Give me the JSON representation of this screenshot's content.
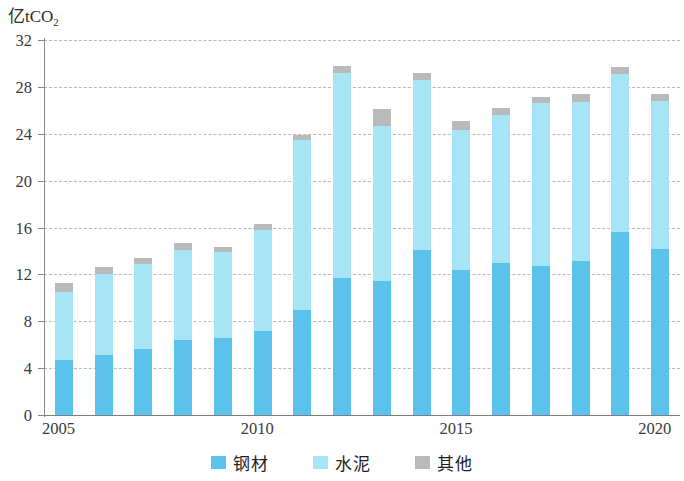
{
  "chart_data": {
    "type": "bar",
    "subtype": "stacked-bar",
    "title": "",
    "xlabel": "",
    "ylabel": "亿tCO₂",
    "ylabel_plain": "亿tCO2",
    "ylim": [
      0,
      32
    ],
    "ytick_step": 4,
    "ytick_labels": [
      "0",
      "4",
      "8",
      "12",
      "16",
      "20",
      "24",
      "28",
      "32"
    ],
    "ytick_values": [
      0,
      4,
      8,
      12,
      16,
      20,
      24,
      28,
      32
    ],
    "grid": true,
    "grid_style": "dashed",
    "grid_color": "#b9b9b9",
    "legend_position": "bottom-center",
    "categories": [
      "2005",
      "2006",
      "2007",
      "2008",
      "2009",
      "2010",
      "2011",
      "2012",
      "2013",
      "2014",
      "2015",
      "2016",
      "2017",
      "2018",
      "2019",
      "2020"
    ],
    "xtick_labels_shown": [
      "2005",
      "2010",
      "2015",
      "2020"
    ],
    "xtick_label_indices": [
      0,
      5,
      10,
      15
    ],
    "series": [
      {
        "name": "钢材",
        "name_en": "steel",
        "color": "#5bc2ec",
        "values": [
          4.7,
          5.1,
          5.6,
          6.4,
          6.6,
          7.2,
          9.0,
          11.7,
          11.4,
          14.1,
          12.4,
          13.0,
          12.7,
          13.1,
          15.6,
          14.2
        ]
      },
      {
        "name": "水泥",
        "name_en": "cement",
        "color": "#a7e4f6",
        "values": [
          5.8,
          6.9,
          7.3,
          7.7,
          7.3,
          8.6,
          14.5,
          17.5,
          13.3,
          14.5,
          11.9,
          12.6,
          13.9,
          13.6,
          13.5,
          12.6
        ]
      },
      {
        "name": "其他",
        "name_en": "other",
        "color": "#b9bbbb",
        "values": [
          0.8,
          0.6,
          0.5,
          0.6,
          0.4,
          0.5,
          0.4,
          0.6,
          1.4,
          0.6,
          0.8,
          0.6,
          0.5,
          0.7,
          0.6,
          0.6
        ]
      }
    ],
    "totals": [
      11.3,
      12.6,
      13.4,
      14.7,
      14.3,
      16.3,
      23.9,
      29.8,
      26.1,
      29.2,
      25.1,
      26.2,
      27.1,
      27.4,
      29.7,
      27.4
    ]
  },
  "legend": {
    "items": [
      {
        "label": "钢材",
        "color": "#5bc2ec"
      },
      {
        "label": "水泥",
        "color": "#a7e4f6"
      },
      {
        "label": "其他",
        "color": "#b9bbbb"
      }
    ]
  },
  "axis": {
    "y_unit_main": "亿tCO",
    "y_unit_sub": "2"
  }
}
